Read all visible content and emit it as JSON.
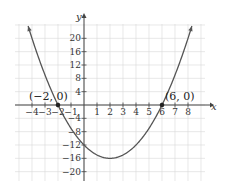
{
  "chart_data": {
    "type": "line",
    "title": "",
    "function": "y = x^2 - 4x - 12",
    "xlabel": "x",
    "ylabel": "y",
    "xlim": [
      -5,
      9
    ],
    "ylim": [
      -24,
      24
    ],
    "grid": true,
    "x_ticks": [
      -4,
      -3,
      -2,
      -1,
      1,
      2,
      3,
      4,
      5,
      6,
      7,
      8
    ],
    "x_tick_labels": [
      "−4",
      "−3",
      "−2",
      "−1",
      "1",
      "2",
      "3",
      "4",
      "5",
      "6",
      "7",
      "8"
    ],
    "y_ticks": [
      20,
      16,
      12,
      8,
      4,
      -4,
      -8,
      -12,
      -16,
      -20
    ],
    "y_tick_labels": [
      "20",
      "16",
      "12",
      "8",
      "4",
      "−4",
      "−8",
      "−12",
      "−16",
      "−20"
    ],
    "series": [
      {
        "name": "parabola",
        "x": [
          -4.3,
          -4,
          -3,
          -2,
          -1,
          0,
          1,
          2,
          3,
          4,
          5,
          6,
          7,
          8,
          8.3
        ],
        "y": [
          23.69,
          20,
          9,
          0,
          -7,
          -12,
          -15,
          -16,
          -15,
          -12,
          -7,
          0,
          9,
          20,
          23.69
        ]
      }
    ],
    "annotations": [
      {
        "label": "(−2, 0)",
        "x": -2,
        "y": 0
      },
      {
        "label": "(6, 0)",
        "x": 6,
        "y": 0
      }
    ],
    "color": "#555555"
  }
}
